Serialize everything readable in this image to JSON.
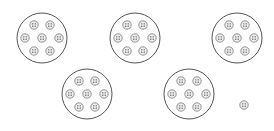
{
  "diagram": {
    "title": "",
    "groups": [
      {
        "label": "group-1",
        "items": 7
      },
      {
        "label": "group-2",
        "items": 7
      },
      {
        "label": "group-3",
        "items": 7
      },
      {
        "label": "group-4",
        "items": 7
      },
      {
        "label": "group-5",
        "items": 7
      }
    ],
    "leftover_items": 1,
    "item_icon": "button-icon",
    "colors": {
      "group_stroke": "#555555",
      "item_stroke": "#777777",
      "item_fill": "#eeeeee",
      "hole_fill": "#333333"
    }
  }
}
